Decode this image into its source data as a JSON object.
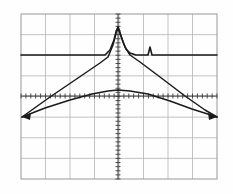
{
  "instrument": {
    "display_name": "oscilloscope-graticule-display",
    "background_color": "#fefefe",
    "grid_color": "#b4b4b4",
    "grid_border_color": "#a0a0a0",
    "trace_color": "#1a1a1a",
    "tick_color": "#3a3a3a",
    "bleed_color": "#e6e6e6"
  },
  "graticule": {
    "left": 21,
    "top": 14,
    "right": 217,
    "bottom": 179,
    "columns": 8,
    "rows": 8,
    "divisions_label": "8 x 8",
    "center_x": 118,
    "center_y": 96,
    "minor_ticks_per_division": 5,
    "minor_tick_length": 5,
    "grid_line_width": 0.8,
    "border_line_width": 1.1
  },
  "artifacts": {
    "top_text": "",
    "left_text": "",
    "bottom_text": "",
    "mid_text": ""
  },
  "chart_data": {
    "type": "line",
    "title": "",
    "subtitle": "",
    "xlabel": "",
    "ylabel": "",
    "grid": true,
    "legend_position": "none",
    "xlim": [
      21,
      217
    ],
    "ylim": [
      14,
      179
    ],
    "x_divisions": 8,
    "y_divisions": 8,
    "axis_style": "center-cross-with-minor-ticks",
    "annotations": [
      {
        "name": "center-peak",
        "x": 118,
        "y": 27,
        "description": "sharp narrow peak at center frequency reaching 4.2 divisions above reference"
      },
      {
        "name": "side-spur",
        "x": 150,
        "y": 48,
        "description": "small narrow spur right of centre, about 1 division above reference"
      },
      {
        "name": "left-marker",
        "x": 22,
        "y": 117,
        "description": "left convergence / arrowhead of lower traces"
      },
      {
        "name": "right-marker",
        "x": 217,
        "y": 117,
        "description": "right convergence / arrowhead of lower traces"
      }
    ],
    "series": [
      {
        "name": "reference-trace",
        "style": "solid",
        "width": 1.6,
        "points": [
          [
            21,
            55
          ],
          [
            60,
            55
          ],
          [
            95,
            55
          ],
          [
            105,
            55
          ],
          [
            110,
            50
          ],
          [
            114,
            40
          ],
          [
            116,
            32
          ],
          [
            118,
            27
          ],
          [
            120,
            33
          ],
          [
            123,
            42
          ],
          [
            126,
            49
          ],
          [
            130,
            53
          ],
          [
            136,
            55
          ],
          [
            145,
            55
          ],
          [
            148,
            55
          ],
          [
            150,
            47
          ],
          [
            152,
            55
          ],
          [
            160,
            55
          ],
          [
            185,
            55
          ],
          [
            217,
            55
          ]
        ]
      },
      {
        "name": "upper-v-trace",
        "style": "solid",
        "width": 1.5,
        "points": [
          [
            22,
            117
          ],
          [
            50,
            97
          ],
          [
            78,
            78
          ],
          [
            100,
            63
          ],
          [
            108,
            57
          ],
          [
            113,
            45
          ],
          [
            116,
            33
          ],
          [
            118,
            27
          ],
          [
            121,
            36
          ],
          [
            125,
            47
          ],
          [
            130,
            55
          ],
          [
            140,
            62
          ],
          [
            160,
            77
          ],
          [
            185,
            96
          ],
          [
            205,
            110
          ],
          [
            217,
            117
          ]
        ]
      },
      {
        "name": "lower-arch-trace",
        "style": "solid",
        "width": 1.5,
        "points": [
          [
            22,
            117
          ],
          [
            45,
            108
          ],
          [
            70,
            100
          ],
          [
            92,
            94
          ],
          [
            108,
            91
          ],
          [
            118,
            90
          ],
          [
            130,
            91
          ],
          [
            148,
            94
          ],
          [
            170,
            101
          ],
          [
            192,
            109
          ],
          [
            217,
            117
          ]
        ]
      }
    ],
    "arrowheads": [
      {
        "name": "left-arrowhead",
        "x": 22,
        "y": 117,
        "direction": "left"
      },
      {
        "name": "right-arrowhead",
        "x": 217,
        "y": 117,
        "direction": "right"
      }
    ]
  }
}
